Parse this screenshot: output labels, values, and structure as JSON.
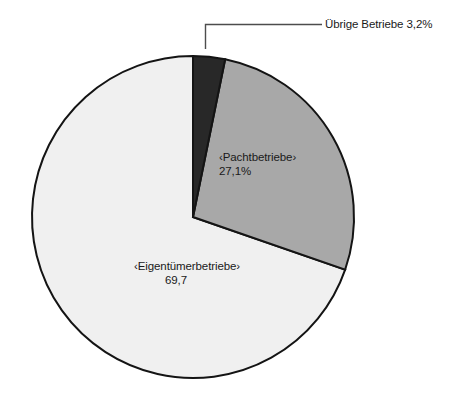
{
  "chart_data": {
    "type": "pie",
    "title": "",
    "subtitle": "",
    "xlabel": "",
    "ylabel": "",
    "legend_position": "none",
    "grid": false,
    "start_angle_deg": 0,
    "direction": "clockwise",
    "units": "percent",
    "categories": [
      "Übrige Betriebe",
      "‹Pachtbetriebe›",
      "‹Eigentümerbetriebe›"
    ],
    "values": [
      3.2,
      27.1,
      69.7
    ],
    "slices": [
      {
        "name": "uebrige-betriebe",
        "label": "Übrige Betriebe",
        "value": 3.2,
        "value_text": "3,2%",
        "combined_text": "Übrige Betriebe 3,2%",
        "color": "#282828",
        "label_placement": "outside-callout"
      },
      {
        "name": "pachtbetriebe",
        "label": "‹Pachtbetriebe›",
        "value": 27.1,
        "value_text": "27,1%",
        "color": "#a8a8a8",
        "label_placement": "inside"
      },
      {
        "name": "eigentuemerbetriebe",
        "label": "‹Eigentümerbetriebe›",
        "value": 69.7,
        "value_text": "69,7",
        "color": "#f0f0f0",
        "label_placement": "inside"
      }
    ],
    "outline_color": "#141414",
    "background_color": "#ffffff"
  },
  "geometry": {
    "center_x": 193,
    "center_y": 217,
    "radius": 161
  },
  "callout": {
    "name": "uebrige-betriebe-callout"
  }
}
